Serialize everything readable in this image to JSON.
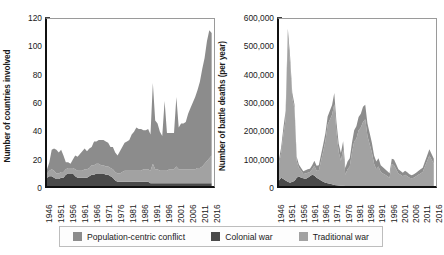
{
  "legend": {
    "items": [
      {
        "label": "Population-centric conflict",
        "color": "#8c8c8c",
        "key": "population_centric"
      },
      {
        "label": "Colonial war",
        "color": "#4a4a4a",
        "key": "colonial"
      },
      {
        "label": "Traditional war",
        "color": "#a2a2a2",
        "key": "traditional"
      }
    ]
  },
  "chart_data": [
    {
      "type": "area",
      "id": "countries-involved",
      "title": "",
      "xlabel": "",
      "ylabel": "Number of countries involved",
      "stacked": true,
      "grid": false,
      "legend_position": "bottom",
      "xlim": [
        1946,
        2017
      ],
      "ylim": [
        0,
        120
      ],
      "ytick_labels": [
        "0",
        "20",
        "40",
        "60",
        "80",
        "100",
        "120"
      ],
      "ytick_values": [
        0,
        20,
        40,
        60,
        80,
        100,
        120
      ],
      "xtick_labels": [
        "1946",
        "1951",
        "1956",
        "1961",
        "1966",
        "1971",
        "1976",
        "1981",
        "1986",
        "1991",
        "1996",
        "2001",
        "2006",
        "2011",
        "2016"
      ],
      "xtick_values": [
        1946,
        1951,
        1956,
        1961,
        1966,
        1971,
        1976,
        1981,
        1986,
        1991,
        1996,
        2001,
        2006,
        2011,
        2016
      ],
      "x": [
        1946,
        1947,
        1948,
        1949,
        1950,
        1951,
        1952,
        1953,
        1954,
        1955,
        1956,
        1957,
        1958,
        1959,
        1960,
        1961,
        1962,
        1963,
        1964,
        1965,
        1966,
        1967,
        1968,
        1969,
        1970,
        1971,
        1972,
        1973,
        1974,
        1975,
        1976,
        1977,
        1978,
        1979,
        1980,
        1981,
        1982,
        1983,
        1984,
        1985,
        1986,
        1987,
        1988,
        1989,
        1990,
        1991,
        1992,
        1993,
        1994,
        1995,
        1996,
        1997,
        1998,
        1999,
        2000,
        2001,
        2002,
        2003,
        2004,
        2005,
        2006,
        2007,
        2008,
        2009,
        2010,
        2011,
        2012,
        2013,
        2014,
        2015,
        2016
      ],
      "series": [
        {
          "name": "Colonial war",
          "color": "#4a4a4a",
          "values": [
            6,
            7,
            7,
            6,
            5,
            5,
            6,
            6,
            8,
            9,
            9,
            9,
            7,
            6,
            6,
            6,
            6,
            6,
            7,
            8,
            8,
            9,
            9,
            9,
            9,
            8,
            8,
            7,
            6,
            4,
            3,
            3,
            3,
            3,
            3,
            3,
            3,
            3,
            3,
            3,
            3,
            3,
            3,
            3,
            2,
            2,
            2,
            2,
            2,
            2,
            2,
            2,
            2,
            2,
            2,
            2,
            2,
            2,
            2,
            2,
            2,
            2,
            2,
            2,
            2,
            2,
            2,
            2,
            2,
            2,
            2
          ]
        },
        {
          "name": "Traditional war",
          "color": "#a2a2a2",
          "values": [
            3,
            4,
            5,
            5,
            4,
            4,
            4,
            4,
            4,
            4,
            4,
            4,
            5,
            5,
            5,
            5,
            6,
            6,
            6,
            7,
            7,
            7,
            7,
            6,
            6,
            6,
            6,
            6,
            6,
            6,
            6,
            6,
            7,
            8,
            8,
            8,
            8,
            8,
            8,
            8,
            8,
            9,
            9,
            9,
            9,
            14,
            10,
            10,
            9,
            9,
            9,
            9,
            10,
            10,
            10,
            12,
            10,
            10,
            10,
            10,
            10,
            10,
            10,
            10,
            11,
            11,
            12,
            14,
            16,
            18,
            20
          ]
        },
        {
          "name": "Population-centric conflict",
          "color": "#8c8c8c",
          "values": [
            3,
            6,
            14,
            16,
            17,
            15,
            16,
            12,
            5,
            4,
            3,
            6,
            10,
            10,
            12,
            14,
            15,
            13,
            14,
            13,
            17,
            16,
            17,
            18,
            18,
            18,
            17,
            15,
            16,
            14,
            13,
            16,
            18,
            20,
            21,
            22,
            26,
            28,
            31,
            30,
            30,
            28,
            28,
            29,
            26,
            58,
            35,
            33,
            28,
            25,
            50,
            27,
            26,
            26,
            26,
            50,
            30,
            33,
            33,
            34,
            40,
            44,
            48,
            52,
            56,
            62,
            70,
            76,
            86,
            92,
            88
          ]
        }
      ],
      "notes": "Stacked area: total peaks ~75 in 1991, ~65 in 1996 and 2001, rising to ~110 by 2015"
    },
    {
      "type": "area",
      "id": "battle-deaths",
      "title": "",
      "xlabel": "",
      "ylabel": "Number of battle deaths (per year)",
      "stacked": true,
      "grid": false,
      "legend_position": "bottom",
      "xlim": [
        1946,
        2017
      ],
      "ylim": [
        0,
        600000
      ],
      "ytick_labels": [
        "0",
        "100,000",
        "200,000",
        "300,000",
        "400,000",
        "500,000",
        "600,000"
      ],
      "ytick_values": [
        0,
        100000,
        200000,
        300000,
        400000,
        500000,
        600000
      ],
      "xtick_labels": [
        "1946",
        "1951",
        "1956",
        "1961",
        "1966",
        "1971",
        "1976",
        "1981",
        "1986",
        "1991",
        "1996",
        "2001",
        "2006",
        "2011",
        "2016"
      ],
      "xtick_values": [
        1946,
        1951,
        1956,
        1961,
        1966,
        1971,
        1976,
        1981,
        1986,
        1991,
        1996,
        2001,
        2006,
        2011,
        2016
      ],
      "x": [
        1946,
        1947,
        1948,
        1949,
        1950,
        1951,
        1952,
        1953,
        1954,
        1955,
        1956,
        1957,
        1958,
        1959,
        1960,
        1961,
        1962,
        1963,
        1964,
        1965,
        1966,
        1967,
        1968,
        1969,
        1970,
        1971,
        1972,
        1973,
        1974,
        1975,
        1976,
        1977,
        1978,
        1979,
        1980,
        1981,
        1982,
        1983,
        1984,
        1985,
        1986,
        1987,
        1988,
        1989,
        1990,
        1991,
        1992,
        1993,
        1994,
        1995,
        1996,
        1997,
        1998,
        1999,
        2000,
        2001,
        2002,
        2003,
        2004,
        2005,
        2006,
        2007,
        2008,
        2009,
        2010,
        2011,
        2012,
        2013,
        2014,
        2015,
        2016
      ],
      "series": [
        {
          "name": "Colonial war",
          "color": "#4a4a4a",
          "values": [
            20000,
            30000,
            25000,
            20000,
            15000,
            12000,
            15000,
            18000,
            30000,
            35000,
            30000,
            28000,
            25000,
            30000,
            35000,
            40000,
            38000,
            30000,
            25000,
            20000,
            15000,
            12000,
            10000,
            8000,
            6000,
            4000,
            3000,
            2000,
            1000,
            500,
            0,
            0,
            0,
            0,
            0,
            0,
            0,
            0,
            0,
            0,
            0,
            0,
            0,
            0,
            0,
            0,
            0,
            0,
            0,
            0,
            0,
            0,
            0,
            0,
            0,
            0,
            0,
            0,
            0,
            0,
            0,
            0,
            0,
            0,
            0,
            0,
            0,
            0,
            0,
            0,
            0
          ]
        },
        {
          "name": "Traditional war",
          "color": "#a2a2a2",
          "values": [
            60000,
            90000,
            160000,
            220000,
            520000,
            430000,
            300000,
            260000,
            60000,
            30000,
            25000,
            15000,
            20000,
            18000,
            15000,
            20000,
            35000,
            25000,
            30000,
            70000,
            110000,
            150000,
            210000,
            230000,
            250000,
            290000,
            190000,
            120000,
            90000,
            130000,
            40000,
            60000,
            70000,
            120000,
            160000,
            170000,
            200000,
            210000,
            230000,
            240000,
            180000,
            150000,
            120000,
            80000,
            60000,
            70000,
            50000,
            45000,
            40000,
            35000,
            30000,
            80000,
            75000,
            60000,
            45000,
            40000,
            35000,
            40000,
            35000,
            30000,
            28000,
            30000,
            35000,
            40000,
            45000,
            50000,
            70000,
            90000,
            110000,
            95000,
            80000
          ]
        },
        {
          "name": "Population-centric conflict",
          "color": "#8c8c8c",
          "values": [
            15000,
            20000,
            25000,
            30000,
            30000,
            25000,
            20000,
            15000,
            15000,
            12000,
            10000,
            10000,
            12000,
            12000,
            12000,
            15000,
            18000,
            18000,
            20000,
            22000,
            25000,
            28000,
            30000,
            32000,
            35000,
            40000,
            35000,
            30000,
            28000,
            30000,
            25000,
            28000,
            30000,
            35000,
            40000,
            45000,
            48000,
            50000,
            55000,
            52000,
            45000,
            40000,
            35000,
            30000,
            28000,
            30000,
            25000,
            22000,
            20000,
            18000,
            16000,
            18000,
            20000,
            18000,
            15000,
            14000,
            13000,
            15000,
            14000,
            12000,
            11000,
            12000,
            13000,
            14000,
            15000,
            16000,
            18000,
            20000,
            22000,
            20000,
            18000
          ]
        }
      ],
      "notes": "Stacked area: Korean War peak ~550,000 around 1950-51, Vietnam peak ~290,000 in 1971, Iran-Iraq/Afghanistan ~240,000 in 1984-85, Syria rise ~2014"
    }
  ]
}
